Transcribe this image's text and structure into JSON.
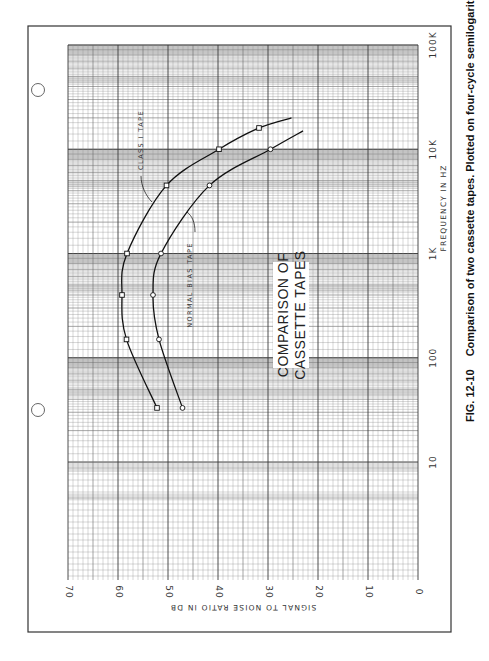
{
  "chart_data": {
    "type": "line",
    "title": "COMPARISON OF CASSETTE TAPES",
    "title_lines": [
      "COMPARISON OF",
      "CASSETTE TAPES"
    ],
    "xlabel": "FREQUENCY IN HZ",
    "ylabel": "SIGNAL TO NOISE RATIO IN DB",
    "x_scale": "log",
    "xlim": [
      10,
      100000
    ],
    "ylim": [
      0,
      70
    ],
    "x_ticks": [
      {
        "value": 10,
        "label": "10"
      },
      {
        "value": 100,
        "label": "100"
      },
      {
        "value": 1000,
        "label": "1K"
      },
      {
        "value": 10000,
        "label": "10K"
      },
      {
        "value": 100000,
        "label": "100K"
      }
    ],
    "y_ticks": [
      {
        "value": 0,
        "label": "0"
      },
      {
        "value": 10,
        "label": "10"
      },
      {
        "value": 20,
        "label": "20"
      },
      {
        "value": 30,
        "label": "30"
      },
      {
        "value": 40,
        "label": "40"
      },
      {
        "value": 50,
        "label": "50"
      },
      {
        "value": 60,
        "label": "60"
      },
      {
        "value": 70,
        "label": "70"
      }
    ],
    "grid": true,
    "orientation": "rotated 90° counter-clockwise",
    "series": [
      {
        "name": "CLASS I TAPE",
        "marker": "square",
        "x": [
          33,
          150,
          400,
          1000,
          4500,
          10000,
          16000
        ],
        "y": [
          52.2,
          58.3,
          59.2,
          58.2,
          50.3,
          39.8,
          31.8
        ],
        "curve_end": {
          "x": 20000,
          "y": 25.3
        }
      },
      {
        "name": "NORMAL BIAS TAPE",
        "marker": "circle",
        "x": [
          33,
          150,
          400,
          1000,
          4500,
          10000
        ],
        "y": [
          47.1,
          51.8,
          53.0,
          51.4,
          41.7,
          29.5
        ],
        "curve_end": {
          "x": 15000,
          "y": 23.0
        }
      }
    ]
  },
  "caption": {
    "number": "FIG. 12-10",
    "text": "Comparison of two cassette tapes. Plotted on four-cycle semilogarithmic paper."
  }
}
